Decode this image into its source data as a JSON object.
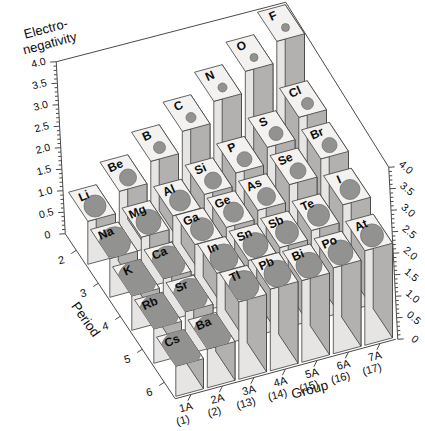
{
  "chart_data": {
    "type": "bar",
    "variant": "3d-bar-grid",
    "value_axis": {
      "title_lines": [
        "Electro-",
        "negativity"
      ],
      "min": 0,
      "max": 4,
      "major_step": 0.5,
      "minor_step": 0.1,
      "tick_labels": [
        "0",
        "0.5",
        "1.0",
        "1.5",
        "2.0",
        "2.5",
        "3.0",
        "3.5",
        "4.0"
      ],
      "shown_on": "left-and-right"
    },
    "group_axis": {
      "title": "Group",
      "categories": [
        {
          "line1": "1A",
          "line2": "(1)"
        },
        {
          "line1": "2A",
          "line2": "(2)"
        },
        {
          "line1": "3A",
          "line2": "(13)"
        },
        {
          "line1": "4A",
          "line2": "(14)"
        },
        {
          "line1": "5A",
          "line2": "(15)"
        },
        {
          "line1": "6A",
          "line2": "(16)"
        },
        {
          "line1": "7A",
          "line2": "(17)"
        }
      ]
    },
    "period_axis": {
      "title": "Period",
      "categories": [
        "2",
        "3",
        "4",
        "5",
        "6"
      ]
    },
    "rows": [
      {
        "period": "2",
        "cells": [
          {
            "symbol": "Li",
            "en": 1.0,
            "atom_dot_size": 11
          },
          {
            "symbol": "Be",
            "en": 1.5,
            "atom_dot_size": 8.5
          },
          {
            "symbol": "B",
            "en": 2.0,
            "atom_dot_size": 6
          },
          {
            "symbol": "C",
            "en": 2.5,
            "atom_dot_size": 5
          },
          {
            "symbol": "N",
            "en": 3.0,
            "atom_dot_size": 4.5
          },
          {
            "symbol": "O",
            "en": 3.5,
            "atom_dot_size": 4
          },
          {
            "symbol": "F",
            "en": 4.0,
            "atom_dot_size": 4
          }
        ]
      },
      {
        "period": "3",
        "cells": [
          {
            "symbol": "Na",
            "en": 0.9,
            "atom_dot_size": 15.5
          },
          {
            "symbol": "Mg",
            "en": 1.2,
            "atom_dot_size": 12.5
          },
          {
            "symbol": "Al",
            "en": 1.5,
            "atom_dot_size": 10.5
          },
          {
            "symbol": "Si",
            "en": 1.8,
            "atom_dot_size": 8.5
          },
          {
            "symbol": "P",
            "en": 2.1,
            "atom_dot_size": 7.5
          },
          {
            "symbol": "S",
            "en": 2.5,
            "atom_dot_size": 7
          },
          {
            "symbol": "Cl",
            "en": 3.0,
            "atom_dot_size": 6
          }
        ]
      },
      {
        "period": "4",
        "cells": [
          {
            "symbol": "K",
            "en": 0.8,
            "atom_dot_size": 19
          },
          {
            "symbol": "Ca",
            "en": 1.0,
            "atom_dot_size": 16.5
          },
          {
            "symbol": "Ga",
            "en": 1.6,
            "atom_dot_size": 11.5
          },
          {
            "symbol": "Ge",
            "en": 1.8,
            "atom_dot_size": 10
          },
          {
            "symbol": "As",
            "en": 2.0,
            "atom_dot_size": 9
          },
          {
            "symbol": "Se",
            "en": 2.4,
            "atom_dot_size": 8
          },
          {
            "symbol": "Br",
            "en": 2.8,
            "atom_dot_size": 7.5
          }
        ]
      },
      {
        "period": "5",
        "cells": [
          {
            "symbol": "Rb",
            "en": 0.8,
            "atom_dot_size": 19.5
          },
          {
            "symbol": "Sr",
            "en": 1.0,
            "atom_dot_size": 17
          },
          {
            "symbol": "In",
            "en": 1.7,
            "atom_dot_size": 14
          },
          {
            "symbol": "Sn",
            "en": 1.8,
            "atom_dot_size": 12.5
          },
          {
            "symbol": "Sb",
            "en": 1.9,
            "atom_dot_size": 11.5
          },
          {
            "symbol": "Te",
            "en": 2.1,
            "atom_dot_size": 11
          },
          {
            "symbol": "I",
            "en": 2.5,
            "atom_dot_size": 10
          }
        ]
      },
      {
        "period": "6",
        "cells": [
          {
            "symbol": "Cs",
            "en": 0.7,
            "atom_dot_size": 20
          },
          {
            "symbol": "Ba",
            "en": 0.9,
            "atom_dot_size": 18.5
          },
          {
            "symbol": "Tl",
            "en": 1.8,
            "atom_dot_size": 15
          },
          {
            "symbol": "Pb",
            "en": 1.9,
            "atom_dot_size": 13.5
          },
          {
            "symbol": "Bi",
            "en": 1.9,
            "atom_dot_size": 13
          },
          {
            "symbol": "Po",
            "en": 2.0,
            "atom_dot_size": 12.5
          },
          {
            "symbol": "At",
            "en": 2.2,
            "atom_dot_size": 11.5
          }
        ]
      }
    ],
    "colors": {
      "background": "#ffffff",
      "bar_top": "#f3f2f0",
      "bar_front": "#e6e5e3",
      "bar_side": "#b2b1af",
      "bar_stroke": "#3e3e3c",
      "frame_line": "#4a4a48",
      "dot_fill": "#929290",
      "dot_stroke": "#777775",
      "text": "#0d0d0d"
    },
    "legend": null,
    "grid": "none"
  }
}
